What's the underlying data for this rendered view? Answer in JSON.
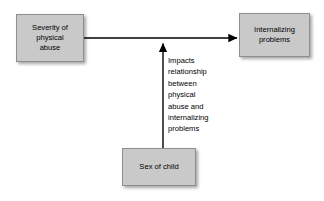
{
  "diagram": {
    "background_color": "#ffffff",
    "node_fill_color": "#c9c9c9",
    "node_border_color": "#8e8e8e",
    "edge_color": "#000000",
    "nodes": [
      {
        "id": "severity",
        "label": "Severity of\nphysical\nabuse"
      },
      {
        "id": "internalizing",
        "label": "Internalizing\nproblems"
      },
      {
        "id": "sex",
        "label": "Sex of child"
      }
    ],
    "annotations": [
      {
        "id": "moderator",
        "text": "Impacts\nrelationship\nbetween\nphysical\nabuse and\ninternalizing\nproblems"
      }
    ]
  }
}
